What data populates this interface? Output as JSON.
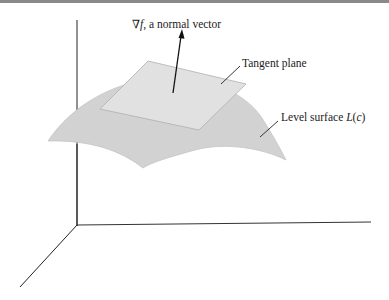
{
  "figure": {
    "labels": {
      "gradient_symbol": "∇",
      "gradient_f": "f",
      "gradient_rest": ", a normal vector",
      "tangent_plane": "Tangent plane",
      "level_surface_prefix": "Level surface ",
      "level_surface_L": "L",
      "level_surface_paren_open": "(",
      "level_surface_c": "c",
      "level_surface_paren_close": ")"
    },
    "colors": {
      "surface_fill": "#d2d2d2",
      "plane_fill": "#e0e0e0",
      "line": "#222222",
      "top_rule": "#8a8a8a"
    }
  }
}
